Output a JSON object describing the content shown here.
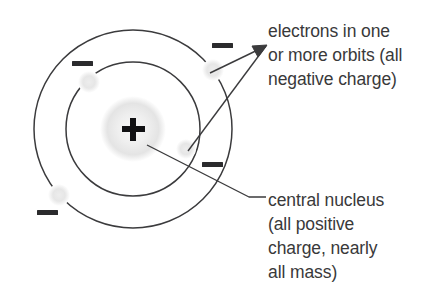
{
  "diagram": {
    "type": "schematic",
    "background_color": "#ffffff",
    "stroke_color": "#3b3b3d",
    "text_color": "#39393a",
    "electron_dot_color": "#e8e8e8",
    "nucleus_glow_color": "#e2e2e2"
  },
  "nucleus": {
    "symbol": "+",
    "center_x": 133,
    "center_y": 129,
    "radius": 32,
    "color": "#000000"
  },
  "orbits": [
    {
      "name": "inner-orbit",
      "center_x": 133,
      "center_y": 129,
      "radius": 67
    },
    {
      "name": "outer-orbit",
      "center_x": 133,
      "center_y": 129,
      "radius": 99
    }
  ],
  "electrons": [
    {
      "name": "electron-top-left",
      "symbol": "−",
      "sign_x": 82,
      "sign_y": 64,
      "dot_x": 89,
      "dot_y": 82,
      "orbit": "inner-orbit"
    },
    {
      "name": "electron-top-right",
      "symbol": "−",
      "sign_x": 222,
      "sign_y": 46,
      "dot_x": 213,
      "dot_y": 70,
      "orbit": "inner-orbit"
    },
    {
      "name": "electron-right",
      "symbol": "−",
      "sign_x": 212,
      "sign_y": 165,
      "dot_x": 186,
      "dot_y": 149,
      "orbit": "inner-orbit"
    },
    {
      "name": "electron-bottom-left",
      "symbol": "−",
      "sign_x": 47,
      "sign_y": 213,
      "dot_x": 59,
      "dot_y": 195,
      "orbit": "outer-orbit"
    }
  ],
  "labels": {
    "electrons": {
      "text": "electrons in one\nor more orbits (all\nnegative charge)",
      "lines": [
        "electrons in one",
        "or more orbits (all",
        "negative charge)"
      ]
    },
    "nucleus": {
      "text": "central nucleus\n(all positive\ncharge, nearly\nall mass)",
      "lines": [
        "central nucleus",
        "(all positive",
        "charge, nearly",
        "all mass)"
      ]
    }
  },
  "leader_lines": [
    {
      "name": "electron-arrow-upper-branch",
      "from_x": 210,
      "from_y": 72,
      "to_x": 266,
      "to_y": 46,
      "arrowhead": true
    },
    {
      "name": "electron-arrow-lower-branch",
      "from_x": 187,
      "from_y": 150,
      "to_x": 266,
      "to_y": 46,
      "arrowhead": true
    },
    {
      "name": "nucleus-pointer-line",
      "from_x": 147,
      "from_y": 145,
      "to_x": 250,
      "to_y": 198,
      "elbow_to_x": 266,
      "elbow_to_y": 198,
      "arrowhead": false
    }
  ]
}
